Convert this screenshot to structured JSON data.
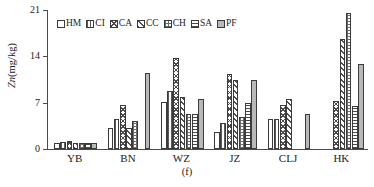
{
  "figure": {
    "subcaption": "(f)",
    "ylabel_italic": "Zn",
    "ylabel_rest": "(mg/kg)"
  },
  "legend": {
    "position": "top-left-inside",
    "items": [
      {
        "label": "HM",
        "pattern": "solid-white"
      },
      {
        "label": "CI",
        "pattern": "vertical-lines"
      },
      {
        "label": "CA",
        "pattern": "cross-hatch-diagonal"
      },
      {
        "label": "CC",
        "pattern": "diagonal-hatch"
      },
      {
        "label": "CH",
        "pattern": "grid-check"
      },
      {
        "label": "SA",
        "pattern": "horizontal-lines"
      },
      {
        "label": "PF",
        "pattern": "solid-gray"
      }
    ]
  },
  "yaxis": {
    "ticks": [
      "0",
      "7",
      "14",
      "21"
    ],
    "min": 0,
    "max": 21
  },
  "chart_data": {
    "type": "bar",
    "title": "",
    "xlabel": "",
    "ylabel": "Zn(mg/kg)",
    "ylim": [
      0,
      21
    ],
    "yticks": [
      0,
      7,
      14,
      21
    ],
    "grid": false,
    "legend_position": "top-left-inside",
    "categories": [
      "YB",
      "BN",
      "WZ",
      "JZ",
      "CLJ",
      "HK"
    ],
    "series": [
      {
        "name": "HM",
        "values": [
          0.9,
          3.1,
          7.1,
          2.6,
          4.5,
          0.0
        ]
      },
      {
        "name": "CI",
        "values": [
          1.0,
          4.6,
          8.7,
          3.9,
          4.5,
          0.0
        ]
      },
      {
        "name": "CA",
        "values": [
          1.2,
          6.6,
          13.7,
          11.4,
          6.6,
          7.3
        ]
      },
      {
        "name": "CC",
        "values": [
          0.9,
          3.1,
          7.9,
          10.4,
          7.6,
          16.6
        ]
      },
      {
        "name": "CH",
        "values": [
          0.9,
          4.2,
          5.3,
          4.8,
          0.0,
          20.5
        ]
      },
      {
        "name": "SA",
        "values": [
          0.9,
          0.0,
          5.3,
          7.0,
          0.0,
          6.5
        ]
      },
      {
        "name": "PF",
        "values": [
          0.9,
          11.5,
          7.6,
          10.5,
          5.3,
          12.8
        ]
      }
    ]
  }
}
